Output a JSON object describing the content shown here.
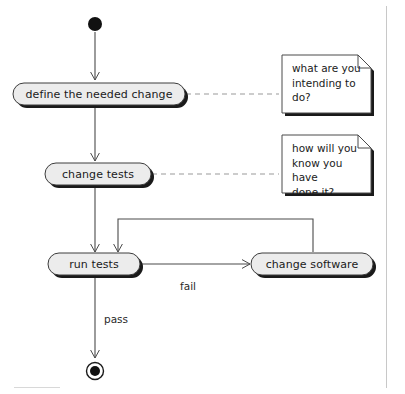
{
  "diagram": {
    "type": "uml-activity-diagram",
    "background_color": "#ffffff",
    "border_color": "#c8c8c8",
    "node_fill_color": "#ececec",
    "node_stroke_color": "#3c3c3c",
    "shadow_color": "#1a1a1a",
    "edge_color": "#4a4a4a",
    "note_dash_color": "#9a9a9a",
    "note_fill_color": "#ffffff",
    "nodes": [
      {
        "id": "start",
        "kind": "initial-node",
        "label": ""
      },
      {
        "id": "define",
        "kind": "action",
        "label": "define the needed change"
      },
      {
        "id": "change_tests",
        "kind": "action",
        "label": "change tests"
      },
      {
        "id": "run_tests",
        "kind": "action",
        "label": "run tests"
      },
      {
        "id": "change_software",
        "kind": "action",
        "label": "change software"
      },
      {
        "id": "end",
        "kind": "final-node",
        "label": ""
      }
    ],
    "notes": [
      {
        "id": "note1",
        "text": "what are you\nintending to\ndo?",
        "attached_to": "define"
      },
      {
        "id": "note2",
        "text": "how will you\nknow you have\ndone it?",
        "attached_to": "change_tests"
      }
    ],
    "edges": [
      {
        "from": "start",
        "to": "define",
        "label": ""
      },
      {
        "from": "define",
        "to": "change_tests",
        "label": ""
      },
      {
        "from": "change_tests",
        "to": "run_tests",
        "label": ""
      },
      {
        "from": "run_tests",
        "to": "change_software",
        "label": "fail"
      },
      {
        "from": "change_software",
        "to": "run_tests",
        "label": ""
      },
      {
        "from": "run_tests",
        "to": "end",
        "label": "pass"
      }
    ],
    "edge_labels": {
      "fail": "fail",
      "pass": "pass"
    }
  }
}
